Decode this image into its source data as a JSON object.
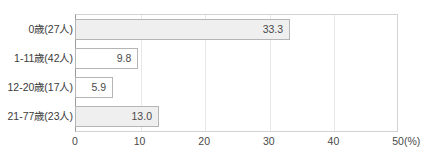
{
  "chart_data": {
    "type": "bar",
    "orientation": "horizontal",
    "title": "",
    "xlabel": "(%)",
    "ylabel": "",
    "xlim": [
      0,
      50
    ],
    "xticks": [
      "0",
      "10",
      "20",
      "30",
      "40",
      "50"
    ],
    "grid": true,
    "legend": "none",
    "categories": [
      "0歳(27人)",
      "1-11歳(42人)",
      "12-20歳(17人)",
      "21-77歳(23人)"
    ],
    "values": [
      33.3,
      9.8,
      5.9,
      13.0
    ],
    "value_labels": [
      "33.3",
      "9.8",
      "5.9",
      "13.0"
    ],
    "bar_fills": [
      "#efefef",
      "#ffffff",
      "#ffffff",
      "#efefef"
    ],
    "bar_border_color": "#b5b5b5",
    "axis_color": "#9a9a9a",
    "grid_color": "#e8e8e8",
    "text_color": "#4a4a4a"
  }
}
